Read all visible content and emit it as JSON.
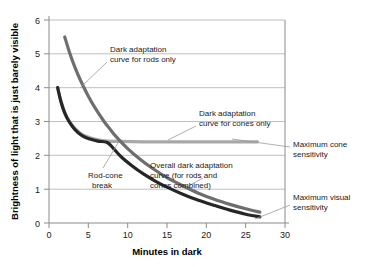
{
  "chart_data": {
    "type": "line",
    "title": "",
    "xlabel": "Minutes in dark",
    "ylabel": "Brightness of light that is just barely visible",
    "xlim": [
      0,
      30
    ],
    "ylim": [
      0,
      6
    ],
    "xticks": [
      "0",
      "5",
      "10",
      "15",
      "20",
      "25",
      "30"
    ],
    "yticks": [
      "0",
      "1",
      "2",
      "3",
      "4",
      "5",
      "6"
    ],
    "grid": "horizontal",
    "legend_position": "inline-annotations",
    "series": [
      {
        "name": "Dark adaptation curve for rods only",
        "color": "#6e6e6e",
        "points": [
          [
            2.0,
            5.5
          ],
          [
            2.6,
            5.05
          ],
          [
            3.3,
            4.6
          ],
          [
            4.0,
            4.22
          ],
          [
            5.0,
            3.75
          ],
          [
            6.0,
            3.35
          ],
          [
            7.0,
            3.0
          ],
          [
            7.6,
            2.82
          ],
          [
            8.5,
            2.56
          ],
          [
            10.0,
            2.2
          ],
          [
            11.5,
            1.9
          ],
          [
            13.0,
            1.64
          ],
          [
            15.0,
            1.34
          ],
          [
            17.0,
            1.1
          ],
          [
            19.0,
            0.88
          ],
          [
            21.0,
            0.7
          ],
          [
            23.0,
            0.55
          ],
          [
            25.0,
            0.42
          ],
          [
            26.8,
            0.32
          ]
        ]
      },
      {
        "name": "Dark adaptation curve for cones only",
        "color": "#a8a8a8",
        "points": [
          [
            1.1,
            4.0
          ],
          [
            1.5,
            3.62
          ],
          [
            2.0,
            3.28
          ],
          [
            2.6,
            3.0
          ],
          [
            3.3,
            2.8
          ],
          [
            4.2,
            2.62
          ],
          [
            5.2,
            2.52
          ],
          [
            6.2,
            2.46
          ],
          [
            7.5,
            2.42
          ],
          [
            9.0,
            2.41
          ],
          [
            12.0,
            2.4
          ],
          [
            16.0,
            2.4
          ],
          [
            20.0,
            2.4
          ],
          [
            24.0,
            2.4
          ],
          [
            26.5,
            2.4
          ]
        ]
      },
      {
        "name": "Overall dark adaptation curve (for rods and cones combined)",
        "color": "#262626",
        "points": [
          [
            1.1,
            4.0
          ],
          [
            1.5,
            3.6
          ],
          [
            2.0,
            3.25
          ],
          [
            2.6,
            2.98
          ],
          [
            3.3,
            2.76
          ],
          [
            4.2,
            2.58
          ],
          [
            5.2,
            2.48
          ],
          [
            6.2,
            2.42
          ],
          [
            7.4,
            2.38
          ],
          [
            8.2,
            2.2
          ],
          [
            9.2,
            1.95
          ],
          [
            10.5,
            1.7
          ],
          [
            12.0,
            1.45
          ],
          [
            13.5,
            1.24
          ],
          [
            15.0,
            1.06
          ],
          [
            17.0,
            0.85
          ],
          [
            19.0,
            0.67
          ],
          [
            21.0,
            0.52
          ],
          [
            23.0,
            0.38
          ],
          [
            25.0,
            0.26
          ],
          [
            26.8,
            0.18
          ]
        ]
      }
    ],
    "annotations": [
      {
        "id": "rods-only",
        "line1": "Dark adaptation",
        "line2": "curve for rods only",
        "line3": ""
      },
      {
        "id": "cones-only",
        "line1": "Dark adaptation",
        "line2": "curve for cones only",
        "line3": ""
      },
      {
        "id": "rod-cone-break",
        "line1": "Rod-cone",
        "line2": "break",
        "line3": ""
      },
      {
        "id": "overall",
        "line1": "Overall dark adaptation",
        "line2": "curve (for rods and",
        "line3": "cones combined)"
      },
      {
        "id": "max-cone-sensitivity",
        "line1": "Maximum cone",
        "line2": "sensitivity",
        "line3": ""
      },
      {
        "id": "max-visual-sensitivity",
        "line1": "Maximum visual",
        "line2": "sensitivity",
        "line3": ""
      }
    ],
    "colors": {
      "rods": "#6e6e6e",
      "cones": "#a8a8a8",
      "combined": "#262626",
      "grid": "#b9b9b9",
      "axis": "#8a8a8a"
    }
  }
}
